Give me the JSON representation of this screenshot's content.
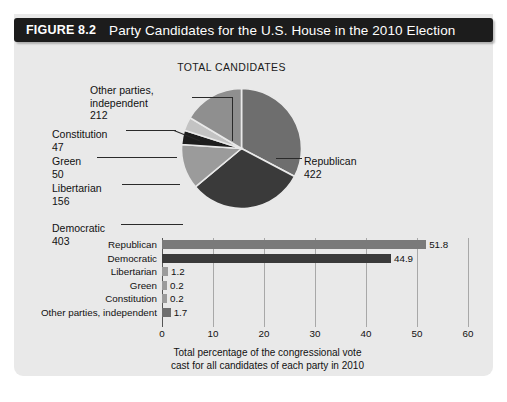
{
  "figure": {
    "number": "FIGURE 8.2",
    "title": "Party Candidates for the U.S. House in the 2010 Election"
  },
  "pie": {
    "heading": "TOTAL CANDIDATES",
    "labels": {
      "other_name_line1": "Other parties,",
      "other_name_line2": "independent",
      "other_value": "212",
      "constitution_name": "Constitution",
      "constitution_value": "47",
      "green_name": "Green",
      "green_value": "50",
      "libertarian_name": "Libertarian",
      "libertarian_value": "156",
      "democratic_name": "Democratic",
      "democratic_value": "403",
      "republican_name": "Republican",
      "republican_value": "422"
    }
  },
  "bars": {
    "caption_line1": "Total percentage of the congressional vote",
    "caption_line2": "cast for all candidates of each party in 2010"
  },
  "chart_data": [
    {
      "type": "pie",
      "title": "TOTAL CANDIDATES",
      "categories": [
        "Republican",
        "Democratic",
        "Libertarian",
        "Green",
        "Constitution",
        "Other parties, independent"
      ],
      "values": [
        422,
        403,
        156,
        50,
        47,
        212
      ],
      "colors": [
        "#6e6e6e",
        "#3a3a3a",
        "#9b9b9b",
        "#1e1e1e",
        "#c3c3c3",
        "#8f8f8f"
      ],
      "legend": "callout-labels",
      "units": "number of candidates"
    },
    {
      "type": "bar",
      "orientation": "horizontal",
      "title": "",
      "xlabel": "Total percentage of the congressional vote cast for all candidates of each party in 2010",
      "ylabel": "",
      "categories": [
        "Republican",
        "Democratic",
        "Libertarian",
        "Green",
        "Constitution",
        "Other parties, independent"
      ],
      "values": [
        51.8,
        44.9,
        1.2,
        0.2,
        0.2,
        1.7
      ],
      "value_labels": [
        "51.8",
        "44.9",
        "1.2",
        "0.2",
        "0.2",
        "1.7"
      ],
      "colors": [
        "#7a7a7a",
        "#3a3a3a",
        "#9b9b9b",
        "#9b9b9b",
        "#9b9b9b",
        "#6e6e6e"
      ],
      "xlim": [
        0,
        60
      ],
      "xticks": [
        0,
        10,
        20,
        30,
        40,
        50,
        60
      ],
      "xtick_labels": [
        "0",
        "10",
        "20",
        "30",
        "40",
        "50",
        "60"
      ],
      "grid": true,
      "legend": "none"
    }
  ],
  "colors": {
    "title_bar_bg": "#1c1c1c",
    "title_bar_text": "#ffffff",
    "card_bg": "#e9e9e9",
    "republican": "#6e6e6e",
    "democratic": "#3a3a3a",
    "libertarian": "#9b9b9b",
    "green": "#1e1e1e",
    "constitution": "#c3c3c3",
    "other": "#8f8f8f"
  }
}
